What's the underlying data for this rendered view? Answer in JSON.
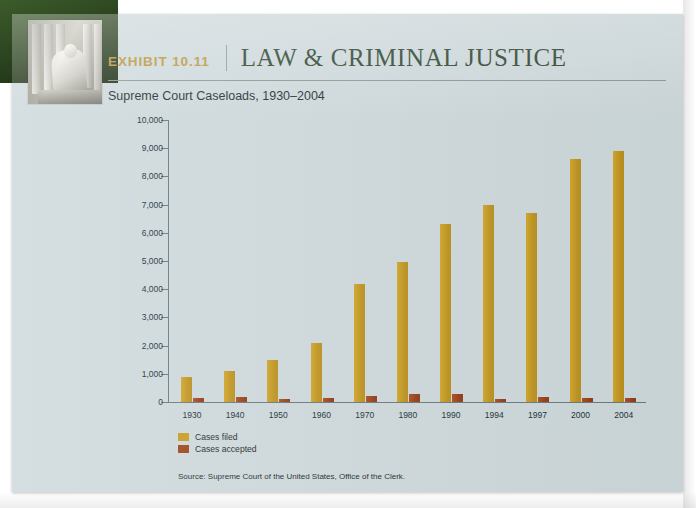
{
  "scan": {
    "page_background": "#ffffff",
    "card_background": "#cfdadd",
    "tab_color": "#2f4a22"
  },
  "header": {
    "exhibit_number": "EXHIBIT 10.11",
    "exhibit_title": "LAW & CRIMINAL JUSTICE",
    "number_color": "#b79538",
    "title_color": "#27402a",
    "photo_alt": "supreme-court-statue-photo"
  },
  "chart_data": {
    "type": "bar",
    "title": "Supreme Court Caseloads, 1930–2004",
    "xlabel": "",
    "ylabel": "",
    "ylim": [
      0,
      10000
    ],
    "grid": false,
    "legend_position": "below-axis-left",
    "categories": [
      "1930",
      "1940",
      "1950",
      "1960",
      "1970",
      "1980",
      "1990",
      "1994",
      "1997",
      "2000",
      "2004"
    ],
    "ytick_labels": [
      "0",
      "1,000",
      "2,000",
      "3,000",
      "4,000",
      "5,000",
      "6,000",
      "7,000",
      "8,000",
      "9,000",
      "10,000"
    ],
    "ytick_values": [
      0,
      1000,
      2000,
      3000,
      4000,
      5000,
      6000,
      7000,
      8000,
      9000,
      10000
    ],
    "series": [
      {
        "name": "Cases filed",
        "color": "#c99d22",
        "values": [
          900,
          1100,
          1500,
          2100,
          4200,
          4950,
          6300,
          7000,
          6700,
          8600,
          8900
        ]
      },
      {
        "name": "Cases accepted",
        "color": "#a0451b",
        "values": [
          150,
          180,
          120,
          150,
          200,
          280,
          300,
          120,
          180,
          150,
          130
        ]
      }
    ],
    "source": "Source: Supreme Court of the United States, Office of the Clerk."
  }
}
